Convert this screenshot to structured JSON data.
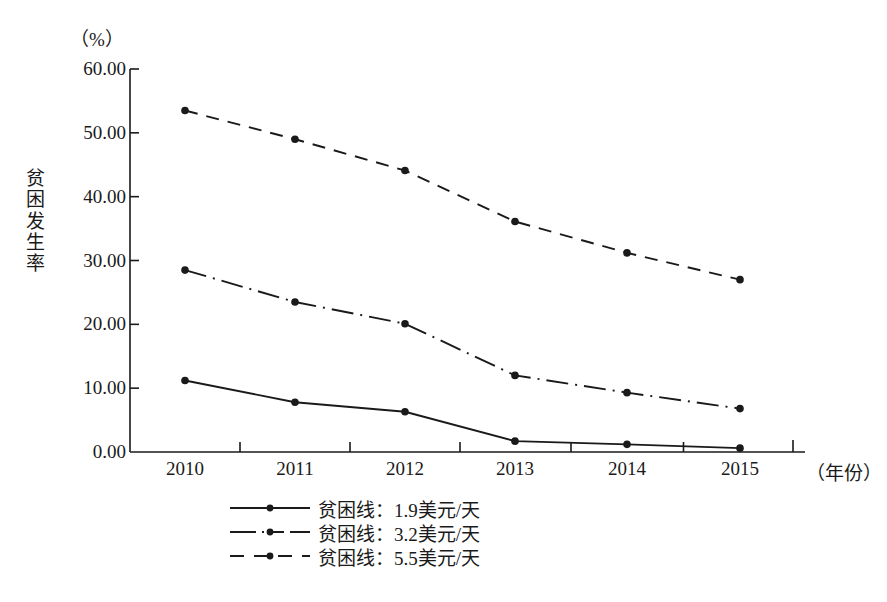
{
  "chart_data": {
    "type": "line",
    "title": "",
    "xlabel": "（年份）",
    "ylabel": "贫困发生率",
    "unit_label": "（%）",
    "categories": [
      "2010",
      "2011",
      "2012",
      "2013",
      "2014",
      "2015"
    ],
    "ylim": [
      0,
      60
    ],
    "ytick_step": 10,
    "ytick_labels": [
      "60.00",
      "50.00",
      "40.00",
      "30.00",
      "20.00",
      "10.00",
      "0.00"
    ],
    "ytick_values": [
      60,
      50,
      40,
      30,
      20,
      10,
      0
    ],
    "grid": false,
    "legend_position": "bottom",
    "series": [
      {
        "name": "贫困线：1.9美元/天",
        "line_style": "solid",
        "marker": "circle",
        "color": "#1a1a1a",
        "values": [
          11.2,
          7.8,
          6.3,
          1.7,
          1.2,
          0.6
        ]
      },
      {
        "name": "贫困线：3.2美元/天",
        "line_style": "dash-dot",
        "marker": "circle",
        "color": "#1a1a1a",
        "values": [
          28.5,
          23.5,
          20.1,
          12.0,
          9.3,
          6.8
        ]
      },
      {
        "name": "贫困线：5.5美元/天",
        "line_style": "dashed",
        "marker": "circle",
        "color": "#1a1a1a",
        "values": [
          53.5,
          49.0,
          44.1,
          36.1,
          31.2,
          27.0
        ]
      }
    ]
  },
  "axes": {
    "y_unit": "（%）",
    "y_title_chars": [
      "贫",
      "困",
      "发",
      "生",
      "率"
    ],
    "x_title": "（年份）"
  },
  "legend": {
    "items": [
      {
        "label": "贫困线：1.9美元/天",
        "style": "solid"
      },
      {
        "label": "贫困线：3.2美元/天",
        "style": "dash-dot"
      },
      {
        "label": "贫困线：5.5美元/天",
        "style": "dashed"
      }
    ]
  }
}
